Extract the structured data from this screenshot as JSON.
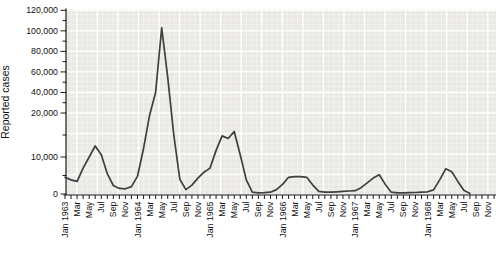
{
  "figure": {
    "y_axis_title": "Reported cases"
  },
  "colors": {
    "page_bg": "#ffffff",
    "plot_bg": "#e9e8e4",
    "grid_minor": "#f2f1ee",
    "grid_major": "#ffffff",
    "line": "#3f3e40",
    "axis": "#1a1a1a",
    "label": "#111111"
  },
  "chart_data": {
    "type": "line",
    "title": "",
    "xlabel": "",
    "ylabel": "Reported cases",
    "grid": "on (graph-paper style, white lines on grey panel)",
    "legend": "none",
    "y_scale": "non-linear: expanded below 20,000 (ticks at 0, 10,000, 20,000), then linear 20,000-120,000 in 20,000 steps",
    "y_tick_values": [
      0,
      10000,
      20000,
      40000,
      60000,
      80000,
      100000,
      120000
    ],
    "y_tick_labels": [
      "0",
      "10,000",
      "20,000",
      "40,000",
      "60,000",
      "80,000",
      "100,000",
      "120,000"
    ],
    "ylim": [
      0,
      120000
    ],
    "x_tick_labels": [
      "Jan 1963",
      "Mar",
      "May",
      "Jul",
      "Sep",
      "Nov",
      "Jan 1964",
      "Mar",
      "May",
      "Jul",
      "Sep",
      "Nov",
      "Jan 1965",
      "Mar",
      "May",
      "Jul",
      "Sep",
      "Nov",
      "Jan 1966",
      "Mar",
      "May",
      "Jul",
      "Sep",
      "Nov",
      "Jan 1967",
      "Mar",
      "May",
      "Jul",
      "Sep",
      "Nov",
      "Jan 1968",
      "Mar",
      "May",
      "Jul",
      "Sep",
      "Nov"
    ],
    "x_minor_tick": "every month",
    "x_label_step_months": 2,
    "series": [
      {
        "name": "Reported cases",
        "x_start": "Jan 1963",
        "x_step": "1 month",
        "values": [
          4500,
          3800,
          3400,
          7000,
          10000,
          12500,
          10500,
          5500,
          2300,
          1500,
          1400,
          2000,
          4800,
          12000,
          19500,
          40000,
          103000,
          55000,
          15000,
          4000,
          1200,
          2400,
          4300,
          5900,
          7000,
          11500,
          14800,
          14200,
          15800,
          10500,
          3800,
          500,
          300,
          350,
          500,
          1200,
          2600,
          4500,
          4700,
          4700,
          4500,
          2400,
          700,
          500,
          500,
          600,
          700,
          800,
          900,
          1700,
          3000,
          4300,
          5200,
          2600,
          500,
          300,
          300,
          350,
          400,
          500,
          600,
          1100,
          3800,
          6800,
          6000,
          3400,
          1000,
          100
        ]
      }
    ],
    "peaks_annotation_free": {
      "1963_peak": 12500,
      "1964_peak": 103000,
      "1965_double_peak": [
        14800,
        15800
      ],
      "1966_plateau": 4700,
      "1967_peak": 5200,
      "1968_peak": 6800
    }
  }
}
